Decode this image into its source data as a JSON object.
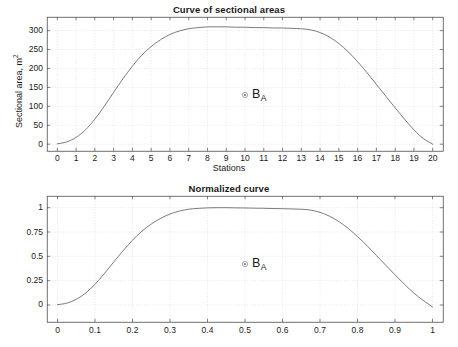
{
  "figure": {
    "background": "#ffffff",
    "axis_color": "#4d4d4d",
    "grid_color": "#d9d9d9",
    "curve_color": "#595959",
    "text_color": "#1a1a1a"
  },
  "panels": [
    {
      "id": "sectional-areas",
      "title": "Curve of sectional areas",
      "xlabel": "Stations",
      "ylabel_text": "Sectional area, m",
      "ylabel_unit": "2",
      "marker": {
        "label": "B",
        "subscript": "A",
        "x": 10,
        "y": 130
      },
      "xticks": [
        "0",
        "1",
        "2",
        "3",
        "4",
        "5",
        "6",
        "7",
        "8",
        "9",
        "10",
        "11",
        "12",
        "13",
        "14",
        "15",
        "16",
        "17",
        "18",
        "19",
        "20"
      ],
      "yticks": [
        "0",
        "50",
        "100",
        "150",
        "200",
        "250",
        "300"
      ]
    },
    {
      "id": "normalized-curve",
      "title": "Normalized curve",
      "xlabel": "",
      "ylabel_text": "",
      "ylabel_unit": "",
      "marker": {
        "label": "B",
        "subscript": "A",
        "x": 0.5,
        "y": 0.42
      },
      "xticks": [
        "0",
        "0.1",
        "0.2",
        "0.3",
        "0.4",
        "0.5",
        "0.6",
        "0.7",
        "0.8",
        "0.9",
        "1"
      ],
      "yticks": [
        "0",
        "0.25",
        "0.5",
        "0.75",
        "1"
      ]
    }
  ],
  "chart_data": [
    {
      "type": "line",
      "title": "Curve of sectional areas",
      "xlabel": "Stations",
      "ylabel": "Sectional area, m^2",
      "xlim": [
        -0.55,
        20.55
      ],
      "ylim": [
        -18,
        336
      ],
      "xticks": [
        0,
        1,
        2,
        3,
        4,
        5,
        6,
        7,
        8,
        9,
        10,
        11,
        12,
        13,
        14,
        15,
        16,
        17,
        18,
        19,
        20
      ],
      "yticks": [
        0,
        50,
        100,
        150,
        200,
        250,
        300
      ],
      "grid": true,
      "legend": null,
      "annotations": [
        {
          "text": "B_A",
          "marker": "circle-dot",
          "x": 10,
          "y": 130
        }
      ],
      "series": [
        {
          "name": "sectional area",
          "x": [
            0,
            0.5,
            1,
            1.5,
            2,
            2.5,
            3,
            3.5,
            4,
            4.5,
            5,
            5.5,
            6,
            6.5,
            7,
            7.5,
            8,
            8.5,
            9,
            9.5,
            10,
            10.5,
            11,
            11.5,
            12,
            12.5,
            13,
            13.5,
            14,
            14.5,
            15,
            15.5,
            16,
            16.5,
            17,
            17.5,
            18,
            18.5,
            19,
            19.5,
            20
          ],
          "y": [
            1,
            6,
            18,
            38,
            66,
            100,
            137,
            173,
            206,
            235,
            258,
            276,
            290,
            299,
            305,
            308,
            310,
            310,
            310,
            309,
            309,
            308,
            308,
            307,
            307,
            306,
            305,
            302,
            295,
            283,
            266,
            244,
            218,
            189,
            158,
            127,
            96,
            66,
            38,
            15,
            0
          ]
        }
      ]
    },
    {
      "type": "line",
      "title": "Normalized curve",
      "xlabel": "",
      "ylabel": "",
      "xlim": [
        -0.028,
        1.028
      ],
      "ylim": [
        -0.175,
        1.12
      ],
      "xticks": [
        0,
        0.1,
        0.2,
        0.3,
        0.4,
        0.5,
        0.6,
        0.7,
        0.8,
        0.9,
        1
      ],
      "yticks": [
        0,
        0.25,
        0.5,
        0.75,
        1
      ],
      "grid": true,
      "legend": null,
      "annotations": [
        {
          "text": "B_A",
          "marker": "circle-dot",
          "x": 0.5,
          "y": 0.42
        }
      ],
      "series": [
        {
          "name": "normalized sectional area",
          "x": [
            0,
            0.025,
            0.05,
            0.075,
            0.1,
            0.125,
            0.15,
            0.175,
            0.2,
            0.225,
            0.25,
            0.275,
            0.3,
            0.325,
            0.35,
            0.375,
            0.4,
            0.425,
            0.45,
            0.475,
            0.5,
            0.525,
            0.55,
            0.575,
            0.6,
            0.625,
            0.65,
            0.675,
            0.7,
            0.725,
            0.75,
            0.775,
            0.8,
            0.825,
            0.85,
            0.875,
            0.9,
            0.925,
            0.95,
            0.975,
            1
          ],
          "y": [
            0.003,
            0.019,
            0.058,
            0.122,
            0.213,
            0.323,
            0.442,
            0.558,
            0.665,
            0.758,
            0.832,
            0.89,
            0.935,
            0.965,
            0.984,
            0.993,
            0.998,
            1.0,
            1.0,
            0.998,
            0.997,
            0.995,
            0.994,
            0.991,
            0.99,
            0.987,
            0.984,
            0.975,
            0.952,
            0.913,
            0.858,
            0.787,
            0.703,
            0.61,
            0.51,
            0.41,
            0.31,
            0.213,
            0.123,
            0.048,
            -0.02
          ]
        }
      ]
    }
  ]
}
